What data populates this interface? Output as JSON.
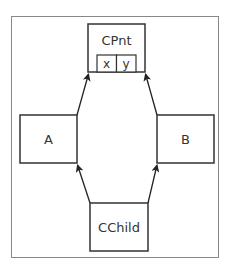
{
  "diagram": {
    "type": "class-inheritance",
    "nodes": {
      "cpnt": {
        "label": "CPnt",
        "fields": [
          "x",
          "y"
        ]
      },
      "a": {
        "label": "A"
      },
      "b": {
        "label": "B"
      },
      "cchild": {
        "label": "CChild"
      }
    },
    "edges": [
      {
        "from": "A",
        "to": "CPnt"
      },
      {
        "from": "B",
        "to": "CPnt"
      },
      {
        "from": "CChild",
        "to": "A"
      },
      {
        "from": "CChild",
        "to": "B"
      }
    ],
    "colors": {
      "stroke": "#333333",
      "frame": "#777777",
      "background": "#ffffff"
    }
  }
}
